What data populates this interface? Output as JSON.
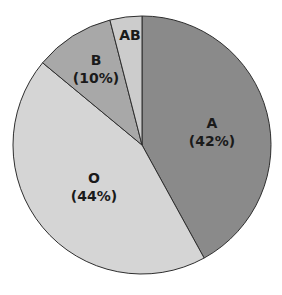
{
  "chart_data": {
    "type": "pie",
    "title": "",
    "start_angle_deg": 0,
    "direction": "clockwise",
    "categories": [
      "A",
      "O",
      "B",
      "AB"
    ],
    "values": [
      42,
      44,
      10,
      4
    ],
    "slices": [
      {
        "label": "A",
        "percent_label": "(42%)",
        "value": 42,
        "color": "#8a8a8a",
        "label_x": 212,
        "label_y": 128
      },
      {
        "label": "O",
        "percent_label": "(44%)",
        "value": 44,
        "color": "#d5d5d5",
        "label_x": 94,
        "label_y": 183
      },
      {
        "label": "B",
        "percent_label": "(10%)",
        "value": 10,
        "color": "#a8a8a8",
        "label_x": 96,
        "label_y": 65
      },
      {
        "label": "AB",
        "percent_label": "",
        "value": 4,
        "color": "#cccccc",
        "label_x": 130,
        "label_y": 40
      }
    ],
    "legend": "none",
    "center": [
      142,
      145
    ],
    "radius": 129
  }
}
